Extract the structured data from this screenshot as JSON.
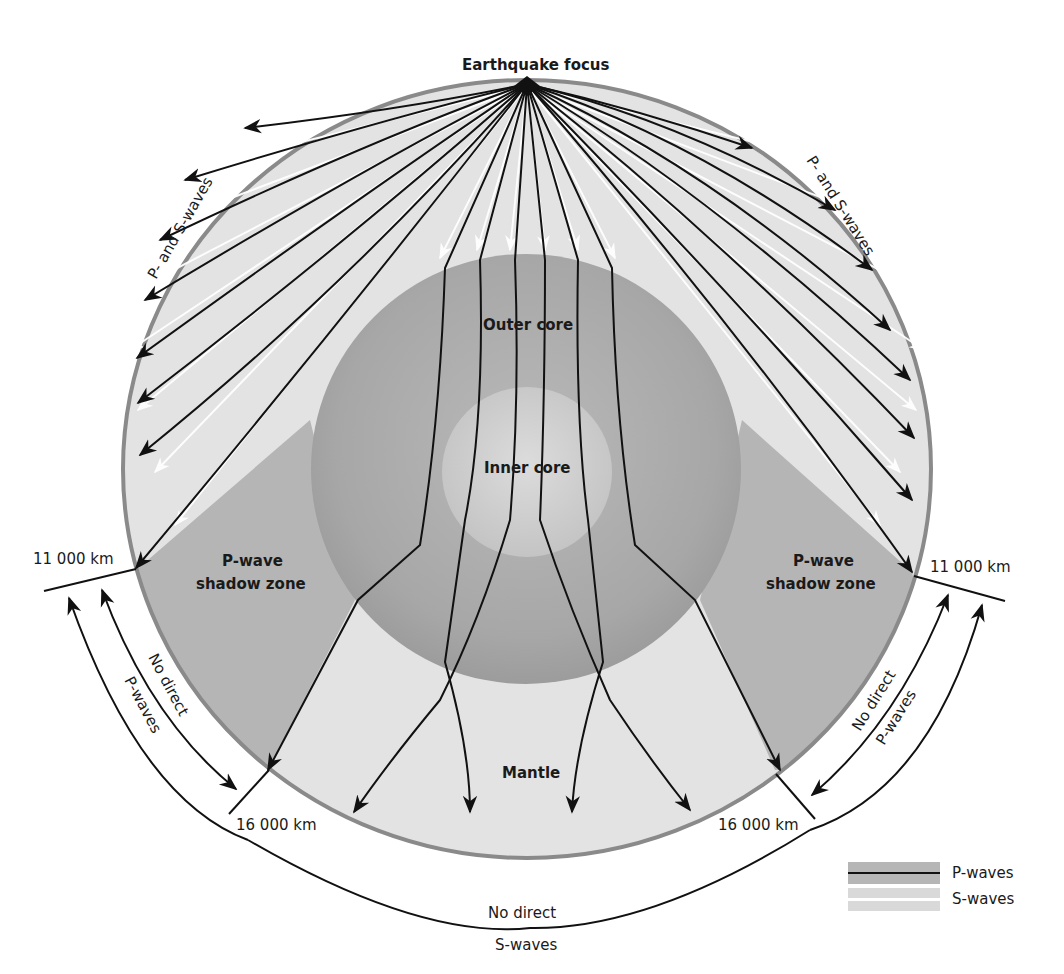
{
  "title": "Earthquake focus",
  "labels": {
    "focus": "Earthquake focus",
    "p_and_s_left": "P- and S-waves",
    "p_and_s_right": "P- and S-waves",
    "outer_core": "Outer core",
    "inner_core": "Inner core",
    "mantle": "Mantle",
    "shadow_left_line1": "P-wave",
    "shadow_left_line2": "shadow zone",
    "shadow_right_line1": "P-wave",
    "shadow_right_line2": "shadow zone",
    "km_11000_left": "11 000 km",
    "km_11000_right": "11 000 km",
    "km_16000_left": "16 000 km",
    "km_16000_right": "16 000 km",
    "no_direct_p_left_1": "No direct",
    "no_direct_p_left_2": "P-waves",
    "no_direct_p_right_1": "No direct",
    "no_direct_p_right_2": "P-waves",
    "no_direct_s_1": "No direct",
    "no_direct_s_2": "S-waves"
  },
  "legend": {
    "items": [
      {
        "label": "P-waves",
        "style": "dark line on gray band"
      },
      {
        "label": "S-waves",
        "style": "light gray double band"
      }
    ]
  },
  "colors": {
    "mantle": "#e2e2e2",
    "mantle_edge": "#8a8a8a",
    "shadow_zone": "#b4b4b4",
    "outer_core": "#a9a9a9",
    "inner_core": "#d0d0d0",
    "p_wave": "#111111",
    "s_wave": "#ffffff"
  }
}
